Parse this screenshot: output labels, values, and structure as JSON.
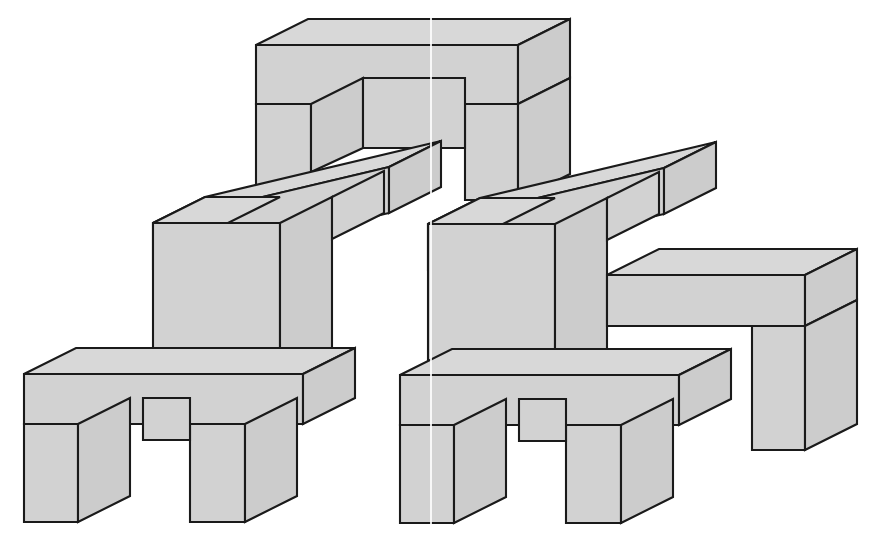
{
  "figure": {
    "width": 876,
    "height": 546,
    "background_color": "#ffffff",
    "fill_color": "#d2d2d2",
    "fill_color_top": "#d8d8d8",
    "fill_color_side": "#cccccc",
    "stroke_color": "#1a1a1a",
    "stroke_width": 2.1,
    "projection": {
      "depth_dx": 52,
      "depth_dy": -26,
      "note": "2:1 axonometric, depth axis goes up and to the right"
    },
    "scan_seam_x": 430
  },
  "shapes": [
    {
      "name": "top-arch-lintel-top",
      "kind": "top-face",
      "points": "256,45 308,19 570,19 518,45"
    },
    {
      "name": "top-arch-lintel-front",
      "kind": "front-face",
      "points": "256,45 518,45 518,104 256,104"
    },
    {
      "name": "top-arch-lintel-side",
      "kind": "side-face",
      "points": "518,45 570,19 570,78 518,104"
    },
    {
      "name": "top-arch-left-leg-front",
      "kind": "front-face",
      "points": "256,104 311,104 311,198 256,198"
    },
    {
      "name": "top-arch-left-leg-side",
      "kind": "side-face",
      "points": "311,104 363,78 363,148 311,172"
    },
    {
      "name": "top-arch-right-leg-front",
      "kind": "front-face",
      "points": "465,104 518,104 518,200 465,200"
    },
    {
      "name": "top-arch-right-leg-side",
      "kind": "side-face",
      "points": "518,104 570,78 570,174 518,200"
    },
    {
      "name": "top-arch-inner-back-wall",
      "kind": "inner-face",
      "points": "363,78 465,78 465,148 363,148"
    },
    {
      "name": "left-beam-top",
      "kind": "top-face",
      "points": "153,223 205,197 441,141 389,167"
    },
    {
      "name": "left-beam-front",
      "kind": "front-face",
      "points": "153,223 389,167 389,213 153,269"
    },
    {
      "name": "left-beam-side",
      "kind": "side-face",
      "points": "389,167 441,141 441,187 389,213"
    },
    {
      "name": "right-beam-top",
      "kind": "top-face",
      "points": "428,224 480,198 716,142 664,168"
    },
    {
      "name": "right-beam-front",
      "kind": "front-face",
      "points": "428,224 664,168 664,214 428,270"
    },
    {
      "name": "right-beam-side",
      "kind": "side-face",
      "points": "664,168 716,142 716,188 664,214"
    },
    {
      "name": "left-mid-column-top",
      "kind": "top-face",
      "points": "153,223 205,197 280,197 228,223"
    },
    {
      "name": "left-mid-column-front",
      "kind": "front-face",
      "points": "153,223 280,223 280,376 153,376"
    },
    {
      "name": "left-mid-column-side",
      "kind": "side-face",
      "points": "280,223 332,197 332,350 280,376"
    },
    {
      "name": "right-mid-column-top",
      "kind": "top-face",
      "points": "428,224 480,198 555,198 503,224"
    },
    {
      "name": "right-mid-column-front",
      "kind": "front-face",
      "points": "428,224 555,224 555,377 428,377"
    },
    {
      "name": "right-mid-column-side",
      "kind": "side-face",
      "points": "555,224 607,198 607,351 555,377"
    },
    {
      "name": "right-outer-shelf-top",
      "kind": "top-face",
      "points": "607,275 659,249 857,249 805,275"
    },
    {
      "name": "right-outer-shelf-front",
      "kind": "front-face",
      "points": "607,275 805,275 805,326 607,326"
    },
    {
      "name": "right-outer-shelf-side",
      "kind": "side-face",
      "points": "805,275 857,249 857,300 805,326"
    },
    {
      "name": "right-outer-leg-front",
      "kind": "front-face",
      "points": "752,326 805,326 805,450 752,450"
    },
    {
      "name": "right-outer-leg-side",
      "kind": "side-face",
      "points": "805,326 857,300 857,424 805,450"
    },
    {
      "name": "left-base-slab-top",
      "kind": "top-face",
      "points": "24,374 76,348 355,348 303,374"
    },
    {
      "name": "left-base-slab-front",
      "kind": "front-face",
      "points": "24,374 303,374 303,424 24,424"
    },
    {
      "name": "left-base-slab-side",
      "kind": "side-face",
      "points": "303,374 355,348 355,398 303,424"
    },
    {
      "name": "left-base-leg-outer-front",
      "kind": "front-face",
      "points": "24,424 78,424 78,522 24,522"
    },
    {
      "name": "left-base-leg-outer-side",
      "kind": "side-face",
      "points": "78,424 130,398 130,496 78,522"
    },
    {
      "name": "left-base-leg-inner-front",
      "kind": "front-face",
      "points": "190,424 245,424 245,522 190,522"
    },
    {
      "name": "left-base-leg-inner-side",
      "kind": "side-face",
      "points": "245,424 297,398 297,496 245,522"
    },
    {
      "name": "left-base-inner-back-wall",
      "kind": "inner-face",
      "points": "143,398 190,398 190,440 143,440"
    },
    {
      "name": "right-base-slab-top",
      "kind": "top-face",
      "points": "400,375 452,349 731,349 679,375"
    },
    {
      "name": "right-base-slab-front",
      "kind": "front-face",
      "points": "400,375 679,375 679,425 400,425"
    },
    {
      "name": "right-base-slab-side",
      "kind": "side-face",
      "points": "679,375 731,349 731,399 679,425"
    },
    {
      "name": "right-base-leg-outer-front",
      "kind": "front-face",
      "points": "400,425 454,425 454,523 400,523"
    },
    {
      "name": "right-base-leg-outer-side",
      "kind": "side-face",
      "points": "454,425 506,399 506,497 454,523"
    },
    {
      "name": "right-base-leg-inner-front",
      "kind": "front-face",
      "points": "566,425 621,425 621,523 566,523"
    },
    {
      "name": "right-base-leg-inner-side",
      "kind": "side-face",
      "points": "621,425 673,399 673,497 621,523"
    },
    {
      "name": "right-base-inner-back-wall",
      "kind": "inner-face",
      "points": "519,399 566,399 566,441 519,441"
    },
    {
      "name": "left-upper-notch-step",
      "kind": "inner-face",
      "points": "332,197 384,171 384,213 332,239"
    },
    {
      "name": "right-upper-notch-step",
      "kind": "inner-face",
      "points": "607,198 659,172 659,214 607,240"
    }
  ],
  "z_order_note": "Shapes are painted in array order; later entries draw over earlier ones"
}
